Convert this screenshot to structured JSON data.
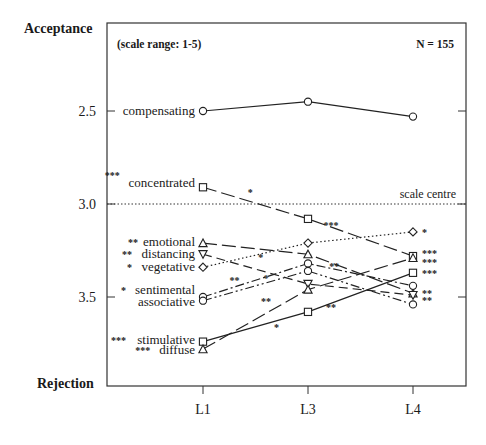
{
  "chart_data": {
    "type": "line",
    "title": "",
    "ylabel_top": "Acceptance",
    "ylabel_bottom": "Rejection",
    "note_left": "(scale range: 1-5)",
    "note_right": "N = 155",
    "reference_line": {
      "label": "scale centre",
      "value": 3.0
    },
    "x": [
      "L1",
      "L3",
      "L4"
    ],
    "y_ticks": [
      {
        "value": 2.5,
        "label": "2.5"
      },
      {
        "value": 3.0,
        "label": "3.0"
      },
      {
        "value": 3.5,
        "label": "3.5"
      }
    ],
    "ylim": [
      2.03,
      3.98
    ],
    "y_inverted": true,
    "grid": false,
    "series": [
      {
        "name": "compensating",
        "marker": "circle",
        "dash": "solid",
        "sig_left": "",
        "sig_right": "",
        "values": [
          2.5,
          2.45,
          2.53
        ]
      },
      {
        "name": "concentrated",
        "marker": "square",
        "dash": "longdash",
        "sig_left": "***",
        "sig_right": "***",
        "values": [
          2.91,
          3.08,
          3.28
        ]
      },
      {
        "name": "emotional",
        "marker": "triangle-up",
        "dash": "longdash",
        "sig_left": "**",
        "sig_right": "**",
        "values": [
          3.21,
          3.27,
          3.48
        ]
      },
      {
        "name": "distancing",
        "marker": "triangle-down",
        "dash": "dash",
        "sig_left": "**",
        "sig_right": "**",
        "values": [
          3.27,
          3.43,
          3.49
        ]
      },
      {
        "name": "vegetative",
        "marker": "diamond",
        "dash": "dotted",
        "sig_left": "*",
        "sig_right": "*",
        "values": [
          3.34,
          3.21,
          3.15
        ]
      },
      {
        "name": "sentimental",
        "marker": "circle",
        "dash": "dashdot",
        "sig_left": "*",
        "sig_right": "",
        "values": [
          3.5,
          3.32,
          3.44
        ]
      },
      {
        "name": "associative",
        "marker": "circle",
        "dash": "dashdotdot",
        "sig_left": "",
        "sig_right": "",
        "values": [
          3.52,
          3.36,
          3.54
        ]
      },
      {
        "name": "stimulative",
        "marker": "square",
        "dash": "solid",
        "sig_left": "***",
        "sig_right": "***",
        "values": [
          3.74,
          3.58,
          3.37
        ]
      },
      {
        "name": "diffuse",
        "marker": "triangle-up",
        "dash": "longdash",
        "sig_left": "***",
        "sig_right": "***",
        "values": [
          3.78,
          3.46,
          3.29
        ]
      }
    ],
    "segment_annotations": [
      {
        "series": "concentrated",
        "segment": "L1-L3",
        "text": "*"
      },
      {
        "series": "concentrated",
        "segment": "L3-L4",
        "text": "***"
      },
      {
        "series": "emotional",
        "segment": "L3-L4",
        "text": "**"
      },
      {
        "series": "vegetative",
        "segment": "L1-L3",
        "text": "*"
      },
      {
        "series": "distancing",
        "segment": "L1-L3",
        "text": "*"
      },
      {
        "series": "sentimental",
        "segment": "L1-L3",
        "text": "**"
      },
      {
        "series": "diffuse",
        "segment": "L1-L3",
        "text": "**"
      },
      {
        "series": "stimulative",
        "segment": "L1-L3",
        "text": "*"
      },
      {
        "series": "stimulative",
        "segment": "L3-L4",
        "text": "**"
      }
    ]
  }
}
